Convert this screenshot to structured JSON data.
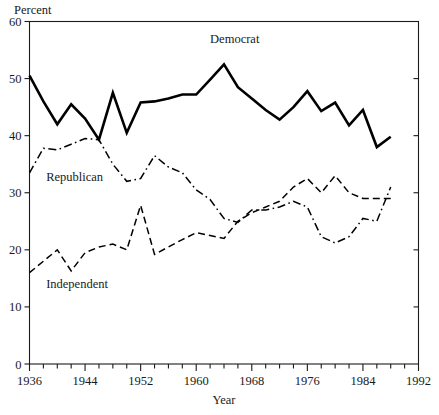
{
  "chart_data": {
    "type": "line",
    "title": "",
    "xlabel": "Year",
    "ylabel": "Percent",
    "xlim": [
      1936,
      1992
    ],
    "ylim": [
      0,
      60
    ],
    "grid": false,
    "legend_position": "inline-annotations",
    "x_major_ticks": [
      1936,
      1944,
      1952,
      1960,
      1968,
      1976,
      1984,
      1992
    ],
    "x_minor_tick_step": 2,
    "y_major_ticks": [
      0,
      10,
      20,
      30,
      40,
      50,
      60
    ],
    "x_tick_labels": [
      "1936",
      "1944",
      "1952",
      "1960",
      "1968",
      "1976",
      "1984",
      "1992"
    ],
    "y_tick_labels": [
      "0",
      "10",
      "20",
      "30",
      "40",
      "50",
      "60"
    ],
    "annotations": [
      {
        "text": "Democrat",
        "x": 1962,
        "y": 56.2
      },
      {
        "text": "Republican",
        "x": 1938.4,
        "y": 32.0
      },
      {
        "text": "Independent",
        "x": 1938.4,
        "y": 13.4
      }
    ],
    "series": [
      {
        "name": "Democrat",
        "style": "solid",
        "color": "#000000",
        "line_width": 2.6,
        "x": [
          1936,
          1938,
          1940,
          1942,
          1944,
          1946,
          1948,
          1950,
          1952,
          1954,
          1956,
          1958,
          1960,
          1962,
          1964,
          1966,
          1968,
          1970,
          1972,
          1974,
          1976,
          1978,
          1980,
          1982,
          1984,
          1986,
          1988
        ],
        "y": [
          50.5,
          46.0,
          42.0,
          45.5,
          43.0,
          39.3,
          47.5,
          40.5,
          45.8,
          46.0,
          46.5,
          47.2,
          47.2,
          49.8,
          52.5,
          48.5,
          46.5,
          44.5,
          42.8,
          45.0,
          47.8,
          44.3,
          45.8,
          41.8,
          44.5,
          38.0,
          39.8
        ]
      },
      {
        "name": "Republican",
        "style": "dashdot",
        "color": "#000000",
        "line_width": 1.5,
        "x": [
          1936,
          1938,
          1940,
          1942,
          1944,
          1946,
          1948,
          1950,
          1952,
          1954,
          1956,
          1958,
          1960,
          1962,
          1964,
          1966,
          1968,
          1970,
          1972,
          1974,
          1976,
          1978,
          1980,
          1982,
          1984,
          1986,
          1988
        ],
        "y": [
          33.5,
          37.8,
          37.5,
          38.5,
          39.5,
          39.3,
          35.0,
          32.0,
          32.5,
          36.5,
          34.5,
          33.5,
          30.5,
          28.8,
          25.5,
          24.8,
          27.0,
          27.0,
          27.5,
          28.5,
          27.5,
          22.3,
          21.2,
          22.3,
          25.5,
          25.0,
          31.0
        ]
      },
      {
        "name": "Independent",
        "style": "dashed",
        "color": "#000000",
        "line_width": 1.5,
        "x": [
          1936,
          1938,
          1940,
          1942,
          1944,
          1946,
          1948,
          1950,
          1952,
          1954,
          1956,
          1958,
          1960,
          1962,
          1964,
          1966,
          1968,
          1970,
          1972,
          1974,
          1976,
          1978,
          1980,
          1982,
          1984,
          1986,
          1988
        ],
        "y": [
          16.0,
          18.0,
          20.0,
          16.3,
          19.5,
          20.5,
          21.0,
          20.0,
          27.8,
          19.2,
          20.5,
          21.8,
          23.0,
          22.5,
          22.0,
          25.0,
          26.5,
          27.5,
          28.5,
          31.0,
          32.5,
          30.0,
          33.0,
          30.0,
          29.0,
          29.0,
          29.0
        ]
      }
    ]
  },
  "axes": {
    "y_axis_title": "Percent",
    "x_axis_title": "Year"
  }
}
